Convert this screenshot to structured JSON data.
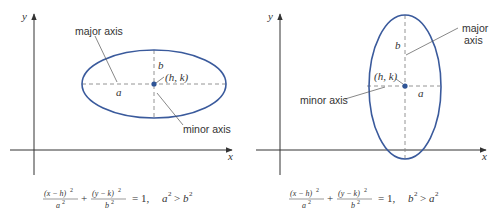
{
  "colors": {
    "ellipse": "#3a5a9c",
    "center_point": "#2f5597",
    "axes": "#333333",
    "dashed_axes": "#888888"
  },
  "left_panel": {
    "axis_labels": {
      "x": "x",
      "y": "y"
    },
    "labels": {
      "major_axis": "major axis",
      "minor_axis": "minor axis",
      "semi_major": "a",
      "semi_minor": "b",
      "center": "(h, k)"
    },
    "equation": {
      "term1_num": "(x − h)",
      "term1_den": "a",
      "term2_num": "(y − k)",
      "term2_den": "b",
      "exp": "2",
      "plus": "+",
      "equals": "= 1,",
      "condition_lhs": "a",
      "condition_op": ">",
      "condition_rhs": "b"
    },
    "orientation": "horizontal"
  },
  "right_panel": {
    "axis_labels": {
      "x": "x",
      "y": "y"
    },
    "labels": {
      "major_axis_line1": "major",
      "major_axis_line2": "axis",
      "minor_axis": "minor axis",
      "semi_major": "b",
      "semi_minor": "a",
      "center": "(h, k)"
    },
    "equation": {
      "term1_num": "(x − h)",
      "term1_den": "a",
      "term2_num": "(y − k)",
      "term2_den": "b",
      "exp": "2",
      "plus": "+",
      "equals": "= 1,",
      "condition_lhs": "b",
      "condition_op": ">",
      "condition_rhs": "a"
    },
    "orientation": "vertical"
  }
}
